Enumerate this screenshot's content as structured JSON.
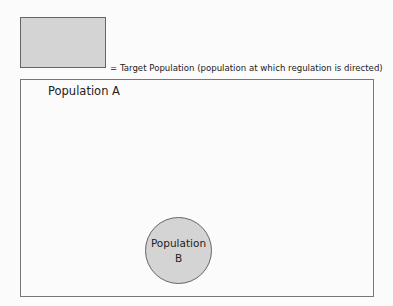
{
  "legend": {
    "swatch_color": "#d4d4d4",
    "text": "= Target Population (population at which regulation is directed)"
  },
  "population_a": {
    "label": "Population A"
  },
  "population_b": {
    "label_line1": "Population",
    "label_line2": "B",
    "fill_color": "#d4d4d4"
  }
}
